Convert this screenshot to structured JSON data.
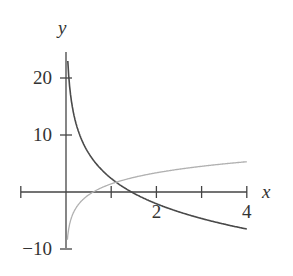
{
  "chart_data": {
    "type": "line",
    "title": "",
    "xlabel": "x",
    "ylabel": "y",
    "xlim": [
      -1,
      4
    ],
    "ylim": [
      -10,
      25
    ],
    "grid": false,
    "legend": null,
    "x_ticks": [
      -1,
      0,
      1,
      2,
      3,
      4
    ],
    "x_tick_labels": [
      {
        "value": 2,
        "label": "2"
      },
      {
        "value": 4,
        "label": "4"
      }
    ],
    "y_ticks": [
      -10,
      0,
      10,
      20
    ],
    "y_tick_labels": [
      {
        "value": 20,
        "label": "20"
      },
      {
        "value": 10,
        "label": "10"
      },
      {
        "value": -10,
        "label": "−10"
      }
    ],
    "series": [
      {
        "name": "dark decreasing curve",
        "color": "#4a4a4a",
        "x": [
          0.03,
          0.1,
          0.25,
          0.5,
          1,
          1.45,
          2,
          3,
          4
        ],
        "y": [
          24.8,
          17.1,
          11.3,
          6.8,
          2.4,
          0,
          -2.1,
          -4.6,
          -6.5
        ]
      },
      {
        "name": "light increasing curve",
        "color": "#b0b0b0",
        "x": [
          0.03,
          0.1,
          0.25,
          0.6,
          1,
          2,
          3,
          4
        ],
        "y": [
          -8.4,
          -5.0,
          -2.4,
          0,
          1.4,
          3.4,
          4.5,
          5.3
        ]
      }
    ]
  }
}
